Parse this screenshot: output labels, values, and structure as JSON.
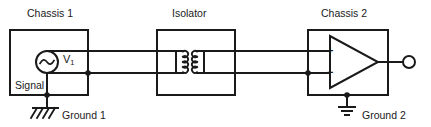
{
  "diagram": {
    "width": 431,
    "height": 127,
    "background_color": "#ffffff",
    "line_color": "#1a1a1a",
    "text_color": "#1a1a1a"
  },
  "labels": {
    "chassis1": "Chassis 1",
    "isolator": "Isolator",
    "chassis2": "Chassis 2",
    "signal": "Signal",
    "ground1": "Ground 1",
    "ground2": "Ground 2",
    "source_name": "V",
    "source_subscript": "1",
    "opamp_plus": "+",
    "opamp_minus": "−"
  },
  "blocks": [
    {
      "name": "chassis-1",
      "label": "Chassis 1",
      "x": 10,
      "y": 30,
      "w": 78,
      "h": 65
    },
    {
      "name": "isolator",
      "label": "Isolator",
      "x": 157,
      "y": 30,
      "w": 78,
      "h": 65
    },
    {
      "name": "chassis-2",
      "label": "Chassis 2",
      "x": 308,
      "y": 30,
      "w": 80,
      "h": 65
    }
  ],
  "components": {
    "ac_source": {
      "name": "ac-voltage-source",
      "cx": 47,
      "cy": 62,
      "r": 11,
      "symbol": "sine-wave"
    },
    "transformer": {
      "name": "isolation-transformer",
      "primary_x": 183,
      "secondary_x": 197,
      "top_y": 51,
      "bottom_y": 73,
      "turns": 4
    },
    "opamp": {
      "name": "operational-amplifier",
      "x": 330,
      "y": 36,
      "w": 48,
      "h": 52,
      "inputs": [
        "+",
        "−"
      ]
    },
    "output_terminal": {
      "name": "output-terminal",
      "cx": 409,
      "cy": 62,
      "r": 6
    },
    "ground1_symbol": {
      "name": "chassis-ground-symbol",
      "type": "chassis",
      "x": 47,
      "y": 110
    },
    "ground2_symbol": {
      "name": "earth-ground-symbol",
      "type": "earth",
      "x": 347,
      "y": 107
    }
  },
  "wires": {
    "top_rail_y": 51,
    "bottom_rail_y": 73,
    "junction_dots": [
      {
        "name": "signal-hot-junction",
        "cx": 88,
        "cy": 73
      },
      {
        "name": "signal-input-junction",
        "cx": 308,
        "cy": 73
      },
      {
        "name": "ground1-tap",
        "cx": 47,
        "cy": 95
      },
      {
        "name": "ground2-tap",
        "cx": 347,
        "cy": 95
      }
    ]
  }
}
